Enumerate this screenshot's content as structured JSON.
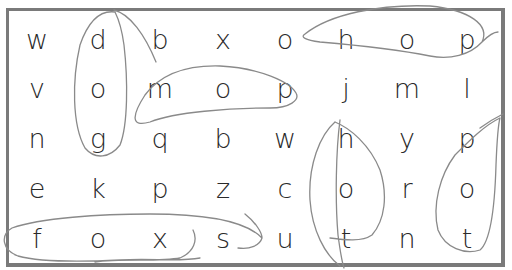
{
  "puzzle": {
    "type": "word-search",
    "rows": [
      [
        "w",
        "d",
        "b",
        "x",
        "o",
        "h",
        "o",
        "p"
      ],
      [
        "v",
        "o",
        "m",
        "o",
        "p",
        "j",
        "m",
        "l"
      ],
      [
        "n",
        "g",
        "q",
        "b",
        "w",
        "h",
        "y",
        "p"
      ],
      [
        "e",
        "k",
        "p",
        "z",
        "c",
        "o",
        "r",
        "o"
      ],
      [
        "f",
        "o",
        "x",
        "s",
        "u",
        "t",
        "n",
        "t"
      ]
    ],
    "circled_words": [
      {
        "word": "dog",
        "direction": "vertical",
        "start": [
          1,
          2
        ],
        "end": [
          3,
          2
        ]
      },
      {
        "word": "mop",
        "direction": "horizontal",
        "start": [
          2,
          3
        ],
        "end": [
          2,
          5
        ]
      },
      {
        "word": "hop",
        "direction": "horizontal",
        "start": [
          1,
          6
        ],
        "end": [
          1,
          8
        ]
      },
      {
        "word": "hot",
        "direction": "vertical",
        "start": [
          3,
          6
        ],
        "end": [
          5,
          6
        ]
      },
      {
        "word": "pot",
        "direction": "vertical",
        "start": [
          3,
          8
        ],
        "end": [
          5,
          8
        ]
      },
      {
        "word": "foxs",
        "direction": "horizontal",
        "start": [
          5,
          1
        ],
        "end": [
          5,
          4
        ]
      }
    ],
    "colors": {
      "border": "#7a7a7a",
      "letters": "#2a2a2a",
      "pencil": "#8a8a8a"
    }
  }
}
